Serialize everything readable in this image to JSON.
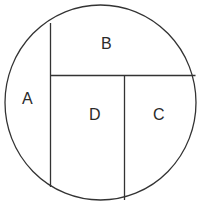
{
  "diagram": {
    "shape": "circle divided into four regions",
    "stroke_color": "#333333",
    "regions": [
      {
        "id": "A",
        "label": "A"
      },
      {
        "id": "B",
        "label": "B"
      },
      {
        "id": "C",
        "label": "C"
      },
      {
        "id": "D",
        "label": "D"
      }
    ]
  }
}
